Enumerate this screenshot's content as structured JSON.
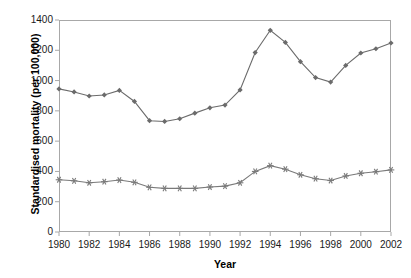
{
  "chart_data": {
    "type": "line",
    "title": "",
    "xlabel": "Year",
    "ylabel": "Standardised mortality (per 100,000)",
    "x": [
      1980,
      1981,
      1982,
      1983,
      1984,
      1985,
      1986,
      1987,
      1988,
      1989,
      1990,
      1991,
      1992,
      1993,
      1994,
      1995,
      1996,
      1997,
      1998,
      1999,
      2000,
      2001,
      2002
    ],
    "xlim": [
      1980,
      2002
    ],
    "ylim": [
      0,
      1400
    ],
    "xticks": [
      1980,
      1982,
      1984,
      1986,
      1988,
      1990,
      1992,
      1994,
      1996,
      1998,
      2000,
      2002
    ],
    "xtick_labels": [
      "1980",
      "1982",
      "1984",
      "1986",
      "1988",
      "1990",
      "1992",
      "1994",
      "1996",
      "1998",
      "2000",
      "2002"
    ],
    "yticks": [
      0,
      200,
      400,
      600,
      800,
      1000,
      1200,
      1400
    ],
    "ytick_labels": [
      "0",
      "200",
      "400",
      "600",
      "800",
      "1000",
      "1200",
      "1400"
    ],
    "grid": false,
    "legend": "none",
    "series": [
      {
        "name": "upper-series",
        "marker": "diamond",
        "color": "#6b6b6b",
        "values": [
          945,
          925,
          898,
          905,
          935,
          862,
          735,
          730,
          748,
          785,
          820,
          838,
          938,
          1185,
          1332,
          1252,
          1125,
          1020,
          990,
          1100,
          1182,
          1210,
          1248
        ]
      },
      {
        "name": "lower-series",
        "marker": "asterisk",
        "color": "#7a7a7a",
        "values": [
          345,
          338,
          325,
          332,
          343,
          328,
          295,
          288,
          288,
          288,
          297,
          303,
          325,
          400,
          438,
          415,
          378,
          352,
          340,
          370,
          388,
          398,
          410
        ]
      }
    ]
  },
  "axes": {
    "frame_color": "#a8a8a8",
    "tick_color": "#a8a8a8"
  }
}
